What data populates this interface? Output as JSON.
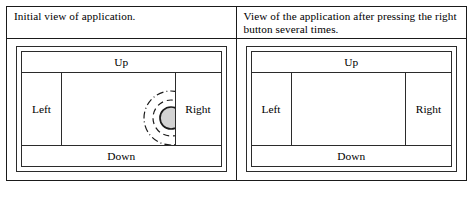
{
  "figure": {
    "panels": [
      {
        "caption": "Initial view of application.",
        "app": {
          "up_label": "Up",
          "down_label": "Down",
          "left_label": "Left",
          "right_label": "Right",
          "ball": {
            "center_x": 109,
            "center_y": 45,
            "radius": 11,
            "fill": "#d3d3d3",
            "stroke": "#1a1a1a"
          },
          "rings": [
            {
              "name": "inner-ring",
              "radius": 18,
              "dash": "6 4",
              "stroke": "#1a1a1a",
              "width": 1.2
            },
            {
              "name": "outer-ring",
              "radius": 27,
              "dash": "7 3 1 3",
              "stroke": "#1a1a1a",
              "width": 1.2
            }
          ]
        }
      },
      {
        "caption": "View of the application after pressing the right button several times.",
        "app": {
          "up_label": "Up",
          "down_label": "Down",
          "left_label": "Left",
          "right_label": "Right",
          "ball": {
            "center_x": 152,
            "center_y": 45,
            "radius": 11,
            "fill": "#d3d3d3",
            "stroke": "#1a1a1a"
          },
          "rings": [
            {
              "name": "inner-ring",
              "radius": 18,
              "dash": "6 4",
              "stroke": "#1a1a1a",
              "width": 1.2
            },
            {
              "name": "outer-ring",
              "radius": 27,
              "dash": "7 3 1 3",
              "stroke": "#1a1a1a",
              "width": 1.2
            }
          ]
        }
      }
    ]
  }
}
